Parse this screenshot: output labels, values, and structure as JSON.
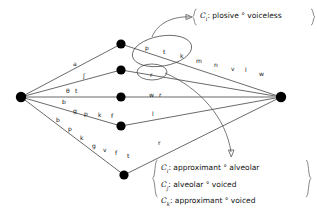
{
  "figure": {
    "type": "phoneme-lattice-diagram",
    "background": "#ffffff",
    "ink": "#111111",
    "midline_color": "#9a9a9a"
  },
  "nodes": [
    {
      "id": "source",
      "x": 21,
      "y": 97,
      "r": 5.2,
      "name": "left-vertex"
    },
    {
      "id": "n1",
      "x": 121,
      "y": 44,
      "r": 4.6,
      "name": "node-row1"
    },
    {
      "id": "n2",
      "x": 121,
      "y": 70,
      "r": 4.6,
      "name": "node-row2"
    },
    {
      "id": "n3",
      "x": 121,
      "y": 97,
      "r": 4.6,
      "name": "node-row3"
    },
    {
      "id": "n4",
      "x": 121,
      "y": 126,
      "r": 4.6,
      "name": "node-row4"
    },
    {
      "id": "n5",
      "x": 124,
      "y": 175,
      "r": 4.6,
      "name": "node-row5"
    },
    {
      "id": "sink",
      "x": 281,
      "y": 97,
      "r": 5.2,
      "name": "right-vertex"
    }
  ],
  "edge_labels": [
    {
      "text": "a",
      "x": 73,
      "y": 61,
      "name": "edge-label-a"
    },
    {
      "text": "ʃ",
      "x": 83,
      "y": 73,
      "name": "edge-label-esh"
    },
    {
      "text": "θ",
      "x": 66,
      "y": 88,
      "name": "edge-label-theta"
    },
    {
      "text": "t",
      "x": 75,
      "y": 88,
      "name": "edge-label-t1"
    },
    {
      "text": "b",
      "x": 62,
      "y": 99,
      "name": "edge-label-b1"
    },
    {
      "text": "g",
      "x": 73,
      "y": 108,
      "name": "edge-label-g1"
    },
    {
      "text": "p",
      "x": 84,
      "y": 111,
      "name": "edge-label-p1"
    },
    {
      "text": "k",
      "x": 98,
      "y": 112,
      "name": "edge-label-k1"
    },
    {
      "text": "f",
      "x": 111,
      "y": 113,
      "name": "edge-label-f1"
    },
    {
      "text": "b",
      "x": 56,
      "y": 117,
      "name": "edge-label-b2"
    },
    {
      "text": "p",
      "x": 68,
      "y": 126,
      "name": "edge-label-p2"
    },
    {
      "text": "k",
      "x": 80,
      "y": 135,
      "name": "edge-label-k2"
    },
    {
      "text": "g",
      "x": 92,
      "y": 143,
      "name": "edge-label-g2"
    },
    {
      "text": "v",
      "x": 103,
      "y": 147,
      "name": "edge-label-v1"
    },
    {
      "text": "f",
      "x": 115,
      "y": 150,
      "name": "edge-label-f2"
    },
    {
      "text": "t",
      "x": 127,
      "y": 153,
      "name": "edge-label-t2"
    },
    {
      "text": "p",
      "x": 145,
      "y": 45,
      "name": "edge-label-p3"
    },
    {
      "text": "t",
      "x": 163,
      "y": 49,
      "name": "edge-label-t3"
    },
    {
      "text": "k",
      "x": 180,
      "y": 53,
      "name": "edge-label-k3"
    },
    {
      "text": "m",
      "x": 196,
      "y": 58,
      "name": "edge-label-m"
    },
    {
      "text": "n",
      "x": 214,
      "y": 62,
      "name": "edge-label-n"
    },
    {
      "text": "v",
      "x": 231,
      "y": 66,
      "name": "edge-label-v2"
    },
    {
      "text": "l",
      "x": 245,
      "y": 67,
      "name": "edge-label-l1"
    },
    {
      "text": "w",
      "x": 259,
      "y": 71,
      "name": "edge-label-w1"
    },
    {
      "text": "r",
      "x": 150,
      "y": 72,
      "name": "edge-label-r-ellipse"
    },
    {
      "text": "w",
      "x": 149,
      "y": 92,
      "name": "edge-label-w2"
    },
    {
      "text": "r",
      "x": 159,
      "y": 92,
      "name": "edge-label-r2"
    },
    {
      "text": "l",
      "x": 152,
      "y": 111,
      "name": "edge-label-l2"
    },
    {
      "text": "r",
      "x": 158,
      "y": 140,
      "name": "edge-label-r3"
    }
  ],
  "ellipses": [
    {
      "cx": 162,
      "cy": 51,
      "rx": 30,
      "ry": 15,
      "rot": -10,
      "name": "ellipse-plosive-group"
    },
    {
      "cx": 152,
      "cy": 72,
      "rx": 15,
      "ry": 8,
      "rot": 0,
      "name": "ellipse-r-group"
    }
  ],
  "annotations": {
    "top": {
      "name": "annotation-plosive-voiceless",
      "x": 196,
      "y": 12,
      "lines": [
        {
          "symbol": "C",
          "sub": "i",
          "text": ": plosive ° voiceless"
        }
      ]
    },
    "bottom": {
      "name": "annotation-approximant-group",
      "x": 157,
      "y": 163,
      "lines": [
        {
          "symbol": "C",
          "sub": "i",
          "text": ": approximant ° alveolar"
        },
        {
          "symbol": "C",
          "sub": "j",
          "text": ": alveolar ° voiced"
        },
        {
          "symbol": "C",
          "sub": "k",
          "text": ": approximant ° voiced"
        }
      ]
    }
  }
}
